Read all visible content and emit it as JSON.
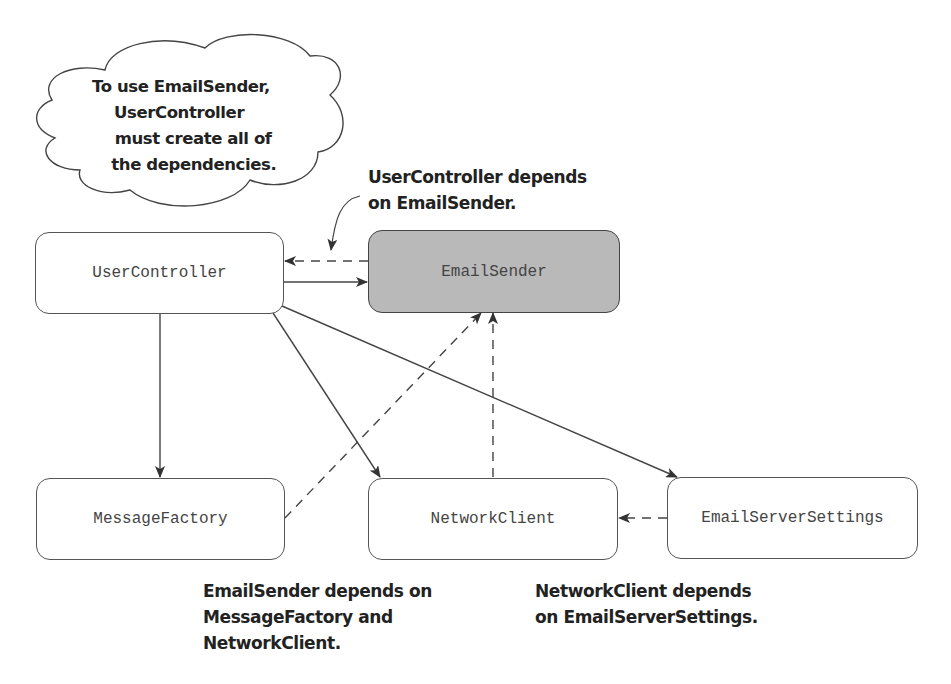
{
  "diagram": {
    "cloud_note": {
      "lines": [
        "To use EmailSender,",
        "UserController",
        "  must create all of",
        " the dependencies."
      ]
    },
    "nodes": {
      "user_controller": {
        "label": "UserController",
        "highlighted": false
      },
      "email_sender": {
        "label": "EmailSender",
        "highlighted": true,
        "fill": "#b9b9b9"
      },
      "message_factory": {
        "label": "MessageFactory",
        "highlighted": false
      },
      "network_client": {
        "label": "NetworkClient",
        "highlighted": false
      },
      "email_server_settings": {
        "label": "EmailServerSettings",
        "highlighted": false
      }
    },
    "edges": [
      {
        "from": "UserController",
        "to": "EmailSender",
        "style": "solid",
        "meaning": "creates"
      },
      {
        "from": "EmailSender",
        "to": "UserController",
        "style": "dashed",
        "meaning": "depends on"
      },
      {
        "from": "UserController",
        "to": "MessageFactory",
        "style": "solid",
        "meaning": "creates"
      },
      {
        "from": "UserController",
        "to": "NetworkClient",
        "style": "solid",
        "meaning": "creates"
      },
      {
        "from": "UserController",
        "to": "EmailServerSettings",
        "style": "solid",
        "meaning": "creates"
      },
      {
        "from": "MessageFactory",
        "to": "EmailSender",
        "style": "dashed",
        "meaning": "depends on"
      },
      {
        "from": "NetworkClient",
        "to": "EmailSender",
        "style": "dashed",
        "meaning": "depends on"
      },
      {
        "from": "EmailServerSettings",
        "to": "NetworkClient",
        "style": "dashed",
        "meaning": "depends on"
      }
    ],
    "annotations": {
      "user_controller_dep": {
        "line1": "UserController depends",
        "line2": "on EmailSender."
      },
      "email_sender_dep": {
        "line1": "EmailSender depends on",
        "line2": "MessageFactory and",
        "line3": "NetworkClient."
      },
      "network_client_dep": {
        "line1": "NetworkClient depends",
        "line2": "on EmailServerSettings."
      }
    },
    "colors": {
      "stroke": "#444444",
      "highlight_fill": "#b9b9b9",
      "text": "#222222",
      "node_text": "#444444"
    }
  }
}
